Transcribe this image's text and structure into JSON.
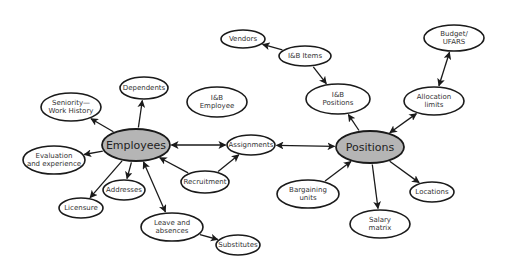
{
  "diagram": {
    "colors": {
      "primary_fill": "#b5b5b5",
      "node_fill": "#ffffff",
      "stroke": "#1a1a1a",
      "text": "#333333"
    },
    "nodes": [
      {
        "id": "employees",
        "lines": [
          "Employees"
        ],
        "cx": 136,
        "cy": 145,
        "rx": 34,
        "ry": 16,
        "primary": true
      },
      {
        "id": "positions",
        "lines": [
          "Positions"
        ],
        "cx": 370,
        "cy": 147,
        "rx": 34,
        "ry": 16,
        "primary": true
      },
      {
        "id": "seniority",
        "lines": [
          "Seniority—",
          "Work History"
        ],
        "cx": 71,
        "cy": 107,
        "rx": 30,
        "ry": 14
      },
      {
        "id": "dependents",
        "lines": [
          "Dependents"
        ],
        "cx": 144,
        "cy": 88,
        "rx": 24,
        "ry": 11
      },
      {
        "id": "ib-employee",
        "lines": [
          "I&B",
          "Employee"
        ],
        "cx": 217,
        "cy": 102,
        "rx": 30,
        "ry": 15
      },
      {
        "id": "evaluation",
        "lines": [
          "Evaluation",
          "and experience"
        ],
        "cx": 54,
        "cy": 160,
        "rx": 31,
        "ry": 14
      },
      {
        "id": "licensure",
        "lines": [
          "Licensure"
        ],
        "cx": 81,
        "cy": 208,
        "rx": 22,
        "ry": 10
      },
      {
        "id": "addresses",
        "lines": [
          "Addresses"
        ],
        "cx": 124,
        "cy": 190,
        "rx": 21,
        "ry": 10
      },
      {
        "id": "leave",
        "lines": [
          "Leave and",
          "absences"
        ],
        "cx": 172,
        "cy": 227,
        "rx": 31,
        "ry": 14
      },
      {
        "id": "substitutes",
        "lines": [
          "Substitutes"
        ],
        "cx": 238,
        "cy": 245,
        "rx": 22,
        "ry": 10
      },
      {
        "id": "recruitment",
        "lines": [
          "Recruitment"
        ],
        "cx": 205,
        "cy": 182,
        "rx": 24,
        "ry": 11
      },
      {
        "id": "assignments",
        "lines": [
          "Assignments"
        ],
        "cx": 251,
        "cy": 145,
        "rx": 24,
        "ry": 10
      },
      {
        "id": "vendors",
        "lines": [
          "Vendors"
        ],
        "cx": 243,
        "cy": 39,
        "rx": 22,
        "ry": 9
      },
      {
        "id": "ib-items",
        "lines": [
          "I&B Items"
        ],
        "cx": 305,
        "cy": 56,
        "rx": 26,
        "ry": 10
      },
      {
        "id": "ib-positions",
        "lines": [
          "I&B",
          "Positions"
        ],
        "cx": 338,
        "cy": 99,
        "rx": 32,
        "ry": 15
      },
      {
        "id": "budget",
        "lines": [
          "Budget/",
          "UFARS"
        ],
        "cx": 454,
        "cy": 38,
        "rx": 30,
        "ry": 13
      },
      {
        "id": "allocation",
        "lines": [
          "Allocation",
          "limits"
        ],
        "cx": 434,
        "cy": 101,
        "rx": 30,
        "ry": 14
      },
      {
        "id": "bargaining",
        "lines": [
          "Bargaining",
          "units"
        ],
        "cx": 308,
        "cy": 194,
        "rx": 31,
        "ry": 14
      },
      {
        "id": "salary",
        "lines": [
          "Salary",
          "matrix"
        ],
        "cx": 380,
        "cy": 224,
        "rx": 30,
        "ry": 14
      },
      {
        "id": "locations",
        "lines": [
          "Locations"
        ],
        "cx": 432,
        "cy": 192,
        "rx": 22,
        "ry": 10
      }
    ],
    "edges": [
      {
        "from": "employees",
        "to": "seniority",
        "bidirectional": false
      },
      {
        "from": "employees",
        "to": "dependents",
        "bidirectional": false
      },
      {
        "from": "employees",
        "to": "evaluation",
        "bidirectional": false
      },
      {
        "from": "employees",
        "to": "licensure",
        "bidirectional": false
      },
      {
        "from": "employees",
        "to": "addresses",
        "bidirectional": false
      },
      {
        "from": "employees",
        "to": "leave",
        "bidirectional": true
      },
      {
        "from": "employees",
        "to": "assignments",
        "bidirectional": true
      },
      {
        "from": "recruitment",
        "to": "employees",
        "bidirectional": false
      },
      {
        "from": "recruitment",
        "to": "assignments",
        "bidirectional": false
      },
      {
        "from": "leave",
        "to": "substitutes",
        "bidirectional": false
      },
      {
        "from": "assignments",
        "to": "positions",
        "bidirectional": true
      },
      {
        "from": "bargaining",
        "to": "positions",
        "bidirectional": false
      },
      {
        "from": "positions",
        "to": "ib-positions",
        "bidirectional": false
      },
      {
        "from": "positions",
        "to": "salary",
        "bidirectional": false
      },
      {
        "from": "positions",
        "to": "locations",
        "bidirectional": false
      },
      {
        "from": "positions",
        "to": "allocation",
        "bidirectional": true
      },
      {
        "from": "allocation",
        "to": "budget",
        "bidirectional": true
      },
      {
        "from": "ib-items",
        "to": "vendors",
        "bidirectional": false
      },
      {
        "from": "ib-items",
        "to": "ib-positions",
        "bidirectional": false
      }
    ]
  }
}
